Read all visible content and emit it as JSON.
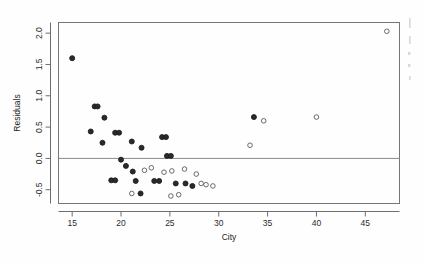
{
  "chart_data": {
    "type": "scatter",
    "title": "",
    "xlabel": "City",
    "ylabel": "Residuals",
    "xlim": [
      13.6,
      48.5
    ],
    "ylim": [
      -0.72,
      2.17
    ],
    "xticks": [
      15,
      20,
      25,
      30,
      35,
      40,
      45
    ],
    "xticklabels": [
      "15",
      "20",
      "25",
      "30",
      "35",
      "40",
      "45"
    ],
    "yticks": [
      -0.5,
      0.0,
      0.5,
      1.0,
      1.5,
      2.0
    ],
    "yticklabels": [
      "-0.5",
      "0.0",
      "0.5",
      "1.0",
      "1.5",
      "2.0"
    ],
    "grid": false,
    "legend": null,
    "reference_line": {
      "orientation": "horizontal",
      "y": 0.0
    },
    "marker": "open-circle",
    "points": [
      {
        "x": 15.0,
        "y": 1.6,
        "style": "dark"
      },
      {
        "x": 17.3,
        "y": 0.83,
        "style": "dark"
      },
      {
        "x": 17.6,
        "y": 0.83,
        "style": "dark"
      },
      {
        "x": 18.3,
        "y": 0.65,
        "style": "dark"
      },
      {
        "x": 16.9,
        "y": 0.43,
        "style": "dark"
      },
      {
        "x": 19.4,
        "y": 0.41,
        "style": "dark"
      },
      {
        "x": 19.8,
        "y": 0.41,
        "style": "dark"
      },
      {
        "x": 18.1,
        "y": 0.25,
        "style": "dark"
      },
      {
        "x": 21.1,
        "y": 0.27,
        "style": "dark"
      },
      {
        "x": 22.1,
        "y": 0.17,
        "style": "dark"
      },
      {
        "x": 24.7,
        "y": 0.04,
        "style": "dark"
      },
      {
        "x": 25.1,
        "y": 0.04,
        "style": "dark"
      },
      {
        "x": 24.2,
        "y": 0.34,
        "style": "dark"
      },
      {
        "x": 24.6,
        "y": 0.34,
        "style": "dark"
      },
      {
        "x": 20.0,
        "y": -0.02,
        "style": "dark"
      },
      {
        "x": 20.5,
        "y": -0.12,
        "style": "dark"
      },
      {
        "x": 21.2,
        "y": -0.21,
        "style": "dark"
      },
      {
        "x": 19.0,
        "y": -0.35,
        "style": "dark"
      },
      {
        "x": 19.4,
        "y": -0.35,
        "style": "dark"
      },
      {
        "x": 21.5,
        "y": -0.36,
        "style": "dark"
      },
      {
        "x": 23.4,
        "y": -0.36,
        "style": "dark"
      },
      {
        "x": 23.9,
        "y": -0.36,
        "style": "dark"
      },
      {
        "x": 25.6,
        "y": -0.4,
        "style": "dark"
      },
      {
        "x": 26.6,
        "y": -0.4,
        "style": "dark"
      },
      {
        "x": 27.3,
        "y": -0.44,
        "style": "dark"
      },
      {
        "x": 22.4,
        "y": -0.19,
        "style": "open"
      },
      {
        "x": 23.1,
        "y": -0.15,
        "style": "open"
      },
      {
        "x": 24.4,
        "y": -0.22,
        "style": "open"
      },
      {
        "x": 25.2,
        "y": -0.2,
        "style": "open"
      },
      {
        "x": 26.5,
        "y": -0.17,
        "style": "open"
      },
      {
        "x": 27.7,
        "y": -0.25,
        "style": "open"
      },
      {
        "x": 28.2,
        "y": -0.4,
        "style": "open"
      },
      {
        "x": 28.7,
        "y": -0.42,
        "style": "open"
      },
      {
        "x": 29.4,
        "y": -0.44,
        "style": "open"
      },
      {
        "x": 21.1,
        "y": -0.56,
        "style": "open"
      },
      {
        "x": 22.0,
        "y": -0.56,
        "style": "dark"
      },
      {
        "x": 25.1,
        "y": -0.6,
        "style": "open"
      },
      {
        "x": 25.9,
        "y": -0.58,
        "style": "open"
      },
      {
        "x": 33.2,
        "y": 0.21,
        "style": "open"
      },
      {
        "x": 33.6,
        "y": 0.66,
        "style": "dark"
      },
      {
        "x": 34.6,
        "y": 0.6,
        "style": "open"
      },
      {
        "x": 40.0,
        "y": 0.66,
        "style": "open"
      },
      {
        "x": 47.2,
        "y": 2.03,
        "style": "open"
      }
    ]
  },
  "axes": {
    "y_title": "Residuals",
    "x_title": "City"
  }
}
